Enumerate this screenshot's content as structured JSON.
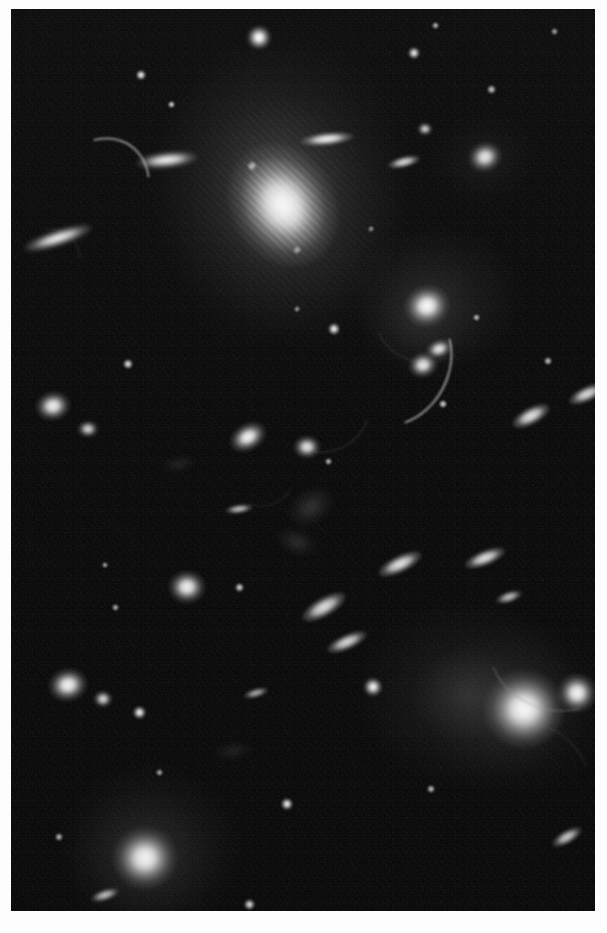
{
  "view": {
    "title": "Galaxy Cluster Deep Field",
    "subject": "galaxy cluster with gravitational lensing arcs",
    "medium": "grayscale astronomical photograph",
    "canvas_width": 607,
    "canvas_height": 933,
    "plate": {
      "left": 11,
      "top": 9,
      "width": 584,
      "height": 902
    },
    "background_color": "#ffffff",
    "sky_color": "#060606",
    "source_color": "#ffffff",
    "caption": ""
  },
  "chart_data": {
    "type": "scatter",
    "xlabel": "",
    "ylabel": "",
    "xlim": [
      0,
      584
    ],
    "ylim": [
      0,
      902
    ],
    "grid": false,
    "legend": "none",
    "annotations": [
      "central cD elliptical galaxy with extended halo",
      "secondary bright elliptical galaxy lower right",
      "multiple gravitationally lensed arcs",
      "numerous cluster member galaxies and foreground stars"
    ],
    "objects": [
      {
        "name": "star-01",
        "kind": "star",
        "x": 248,
        "y": 28,
        "w": 26,
        "h": 25,
        "angle": 0,
        "brightness": 0.98
      },
      {
        "name": "star-02",
        "kind": "star",
        "x": 130,
        "y": 66,
        "w": 12,
        "h": 12,
        "angle": 0,
        "brightness": 0.82
      },
      {
        "name": "star-03",
        "kind": "star",
        "x": 160,
        "y": 95,
        "w": 9,
        "h": 9,
        "angle": 0,
        "brightness": 0.68
      },
      {
        "name": "star-04",
        "kind": "star",
        "x": 403,
        "y": 44,
        "w": 14,
        "h": 14,
        "angle": 0,
        "brightness": 0.8
      },
      {
        "name": "star-05",
        "kind": "star",
        "x": 424,
        "y": 16,
        "w": 9,
        "h": 9,
        "angle": 0,
        "brightness": 0.58
      },
      {
        "name": "star-06",
        "kind": "star",
        "x": 543,
        "y": 22,
        "w": 9,
        "h": 9,
        "angle": 0,
        "brightness": 0.52
      },
      {
        "name": "star-07",
        "kind": "star",
        "x": 480,
        "y": 80,
        "w": 11,
        "h": 11,
        "angle": 0,
        "brightness": 0.66
      },
      {
        "name": "star-08",
        "kind": "star",
        "x": 241,
        "y": 157,
        "w": 12,
        "h": 12,
        "angle": 0,
        "brightness": 0.86
      },
      {
        "name": "star-09",
        "kind": "star",
        "x": 286,
        "y": 241,
        "w": 10,
        "h": 10,
        "angle": 0,
        "brightness": 0.74
      },
      {
        "name": "star-10",
        "kind": "star",
        "x": 323,
        "y": 320,
        "w": 14,
        "h": 14,
        "angle": 0,
        "brightness": 0.84
      },
      {
        "name": "star-11",
        "kind": "star",
        "x": 432,
        "y": 395,
        "w": 10,
        "h": 10,
        "angle": 0,
        "brightness": 0.72
      },
      {
        "name": "star-12",
        "kind": "star",
        "x": 117,
        "y": 355,
        "w": 12,
        "h": 12,
        "angle": 0,
        "brightness": 0.76
      },
      {
        "name": "star-13",
        "kind": "star",
        "x": 465,
        "y": 308,
        "w": 9,
        "h": 9,
        "angle": 0,
        "brightness": 0.6
      },
      {
        "name": "star-14",
        "kind": "star",
        "x": 537,
        "y": 352,
        "w": 10,
        "h": 10,
        "angle": 0,
        "brightness": 0.64
      },
      {
        "name": "star-15",
        "kind": "star",
        "x": 317,
        "y": 452,
        "w": 9,
        "h": 9,
        "angle": 0,
        "brightness": 0.58
      },
      {
        "name": "star-16",
        "kind": "star",
        "x": 228,
        "y": 578,
        "w": 11,
        "h": 11,
        "angle": 0,
        "brightness": 0.7
      },
      {
        "name": "star-17",
        "kind": "star",
        "x": 104,
        "y": 598,
        "w": 9,
        "h": 9,
        "angle": 0,
        "brightness": 0.56
      },
      {
        "name": "star-18",
        "kind": "star",
        "x": 362,
        "y": 678,
        "w": 20,
        "h": 20,
        "angle": 0,
        "brightness": 0.92
      },
      {
        "name": "star-19",
        "kind": "star",
        "x": 276,
        "y": 795,
        "w": 14,
        "h": 14,
        "angle": 0,
        "brightness": 0.82
      },
      {
        "name": "star-20",
        "kind": "star",
        "x": 128,
        "y": 703,
        "w": 15,
        "h": 15,
        "angle": 0,
        "brightness": 0.84
      },
      {
        "name": "star-21",
        "kind": "star",
        "x": 590,
        "y": 668,
        "w": 10,
        "h": 10,
        "angle": 0,
        "brightness": 0.62
      },
      {
        "name": "star-22",
        "kind": "star",
        "x": 420,
        "y": 780,
        "w": 10,
        "h": 10,
        "angle": 0,
        "brightness": 0.62
      },
      {
        "name": "star-23",
        "kind": "star",
        "x": 148,
        "y": 763,
        "w": 9,
        "h": 9,
        "angle": 0,
        "brightness": 0.54
      },
      {
        "name": "star-24",
        "kind": "star",
        "x": 48,
        "y": 828,
        "w": 10,
        "h": 10,
        "angle": 0,
        "brightness": 0.6
      },
      {
        "name": "star-25",
        "kind": "star",
        "x": 238,
        "y": 895,
        "w": 13,
        "h": 13,
        "angle": 0,
        "brightness": 0.74
      },
      {
        "name": "star-26",
        "kind": "star",
        "x": 94,
        "y": 556,
        "w": 8,
        "h": 8,
        "angle": 0,
        "brightness": 0.5
      },
      {
        "name": "star-27",
        "kind": "star",
        "x": 286,
        "y": 300,
        "w": 8,
        "h": 8,
        "angle": 0,
        "brightness": 0.5
      },
      {
        "name": "star-28",
        "kind": "star",
        "x": 360,
        "y": 220,
        "w": 8,
        "h": 8,
        "angle": 0,
        "brightness": 0.48
      },
      {
        "name": "galaxy-cd-central",
        "kind": "ellipse",
        "x": 272,
        "y": 196,
        "w": 104,
        "h": 128,
        "angle": -28,
        "brightness": 1.0
      },
      {
        "name": "galaxy-cd-halo",
        "kind": "halo",
        "x": 272,
        "y": 190,
        "w": 230,
        "h": 290,
        "angle": -25,
        "brightness": 0.42
      },
      {
        "name": "galaxy-bright-br",
        "kind": "ellipse",
        "x": 513,
        "y": 700,
        "w": 80,
        "h": 78,
        "angle": 0,
        "brightness": 1.0
      },
      {
        "name": "galaxy-bright-br-halo",
        "kind": "halo",
        "x": 508,
        "y": 700,
        "w": 190,
        "h": 180,
        "angle": -10,
        "brightness": 0.4
      },
      {
        "name": "galaxy-companion-br",
        "kind": "ellipse",
        "x": 566,
        "y": 684,
        "w": 40,
        "h": 40,
        "angle": 0,
        "brightness": 0.94
      },
      {
        "name": "galaxy-bright-bl",
        "kind": "ellipse",
        "x": 134,
        "y": 849,
        "w": 64,
        "h": 62,
        "angle": 0,
        "brightness": 0.98
      },
      {
        "name": "galaxy-bright-bl-halo",
        "kind": "halo",
        "x": 134,
        "y": 849,
        "w": 150,
        "h": 140,
        "angle": 0,
        "brightness": 0.36
      },
      {
        "name": "galaxy-group-bright",
        "kind": "ellipse",
        "x": 416,
        "y": 297,
        "w": 46,
        "h": 42,
        "angle": -15,
        "brightness": 1.0
      },
      {
        "name": "galaxy-group-halo",
        "kind": "halo",
        "x": 410,
        "y": 310,
        "w": 130,
        "h": 130,
        "angle": 0,
        "brightness": 0.34
      },
      {
        "name": "galaxy-group-b",
        "kind": "ellipse",
        "x": 428,
        "y": 340,
        "w": 28,
        "h": 20,
        "angle": -20,
        "brightness": 0.88
      },
      {
        "name": "galaxy-group-c",
        "kind": "ellipse",
        "x": 412,
        "y": 356,
        "w": 30,
        "h": 26,
        "angle": -15,
        "brightness": 0.9
      },
      {
        "name": "galaxy-upper-right",
        "kind": "ellipse",
        "x": 474,
        "y": 148,
        "w": 34,
        "h": 30,
        "angle": -20,
        "brightness": 0.9
      },
      {
        "name": "galaxy-upper-right-halo",
        "kind": "halo",
        "x": 474,
        "y": 150,
        "w": 110,
        "h": 90,
        "angle": -15,
        "brightness": 0.3
      },
      {
        "name": "galaxy-ne-small",
        "kind": "ellipse",
        "x": 414,
        "y": 120,
        "w": 16,
        "h": 14,
        "angle": 0,
        "brightness": 0.78
      },
      {
        "name": "galaxy-mid-left",
        "kind": "ellipse",
        "x": 42,
        "y": 397,
        "w": 36,
        "h": 30,
        "angle": -10,
        "brightness": 0.92
      },
      {
        "name": "galaxy-mid-left-b",
        "kind": "ellipse",
        "x": 77,
        "y": 420,
        "w": 22,
        "h": 18,
        "angle": 0,
        "brightness": 0.78
      },
      {
        "name": "galaxy-left-low",
        "kind": "ellipse",
        "x": 57,
        "y": 676,
        "w": 40,
        "h": 34,
        "angle": -12,
        "brightness": 0.94
      },
      {
        "name": "galaxy-left-low-b",
        "kind": "ellipse",
        "x": 92,
        "y": 690,
        "w": 20,
        "h": 18,
        "angle": 0,
        "brightness": 0.8
      },
      {
        "name": "galaxy-center-lo",
        "kind": "ellipse",
        "x": 176,
        "y": 578,
        "w": 38,
        "h": 34,
        "angle": 0,
        "brightness": 0.92
      },
      {
        "name": "galaxy-center-top",
        "kind": "ellipse",
        "x": 237,
        "y": 428,
        "w": 40,
        "h": 28,
        "angle": -30,
        "brightness": 0.94
      },
      {
        "name": "galaxy-center-mid",
        "kind": "ellipse",
        "x": 296,
        "y": 438,
        "w": 28,
        "h": 24,
        "angle": 0,
        "brightness": 0.86
      },
      {
        "name": "disk-top-left",
        "kind": "disk",
        "x": 47,
        "y": 229,
        "w": 72,
        "h": 16,
        "angle": -18,
        "brightness": 0.96
      },
      {
        "name": "disk-top-mid",
        "kind": "disk",
        "x": 156,
        "y": 151,
        "w": 62,
        "h": 16,
        "angle": -6,
        "brightness": 0.98
      },
      {
        "name": "disk-top-right",
        "kind": "disk",
        "x": 316,
        "y": 130,
        "w": 54,
        "h": 14,
        "angle": -6,
        "brightness": 0.92
      },
      {
        "name": "disk-up-right-2",
        "kind": "disk",
        "x": 393,
        "y": 153,
        "w": 34,
        "h": 12,
        "angle": -14,
        "brightness": 0.82
      },
      {
        "name": "disk-mid-right",
        "kind": "disk",
        "x": 520,
        "y": 407,
        "w": 42,
        "h": 18,
        "angle": -28,
        "brightness": 0.88
      },
      {
        "name": "disk-right-edge",
        "kind": "disk",
        "x": 576,
        "y": 385,
        "w": 40,
        "h": 16,
        "angle": -25,
        "brightness": 0.84
      },
      {
        "name": "disk-mid-right-lo",
        "kind": "disk",
        "x": 474,
        "y": 549,
        "w": 44,
        "h": 16,
        "angle": -22,
        "brightness": 0.86
      },
      {
        "name": "disk-mid-center",
        "kind": "disk",
        "x": 389,
        "y": 555,
        "w": 48,
        "h": 18,
        "angle": -26,
        "brightness": 0.88
      },
      {
        "name": "disk-center-low",
        "kind": "disk",
        "x": 313,
        "y": 598,
        "w": 50,
        "h": 20,
        "angle": -30,
        "brightness": 0.86
      },
      {
        "name": "disk-low-center",
        "kind": "disk",
        "x": 336,
        "y": 633,
        "w": 44,
        "h": 16,
        "angle": -24,
        "brightness": 0.82
      },
      {
        "name": "disk-low-right",
        "kind": "disk",
        "x": 498,
        "y": 588,
        "w": 28,
        "h": 12,
        "angle": -18,
        "brightness": 0.7
      },
      {
        "name": "disk-left-small",
        "kind": "disk",
        "x": 228,
        "y": 500,
        "w": 28,
        "h": 10,
        "angle": -8,
        "brightness": 0.7
      },
      {
        "name": "disk-bottom-right",
        "kind": "disk",
        "x": 556,
        "y": 828,
        "w": 34,
        "h": 14,
        "angle": -30,
        "brightness": 0.76
      },
      {
        "name": "disk-bottom-left",
        "kind": "disk",
        "x": 94,
        "y": 886,
        "w": 30,
        "h": 12,
        "angle": -18,
        "brightness": 0.7
      },
      {
        "name": "disk-mid-low-2",
        "kind": "disk",
        "x": 245,
        "y": 684,
        "w": 26,
        "h": 10,
        "angle": -16,
        "brightness": 0.62
      },
      {
        "name": "arc-upper-left",
        "kind": "arc",
        "x": 83,
        "y": 185,
        "w": 96,
        "h": 120,
        "angle": 34,
        "thickness": 2.4,
        "brightness": 0.82
      },
      {
        "name": "arc-center-right",
        "kind": "arc",
        "x": 381,
        "y": 352,
        "w": 128,
        "h": 108,
        "angle": 118,
        "thickness": 2.2,
        "brightness": 0.86
      },
      {
        "name": "arc-lens-ring",
        "kind": "arc",
        "x": 414,
        "y": 300,
        "w": 104,
        "h": 104,
        "angle": 200,
        "thickness": 1.8,
        "brightness": 0.55
      },
      {
        "name": "arc-lower-left",
        "kind": "arc",
        "x": 316,
        "y": 405,
        "w": 84,
        "h": 70,
        "angle": 150,
        "thickness": 1.8,
        "brightness": 0.58
      },
      {
        "name": "arc-far-left",
        "kind": "arc",
        "x": 30,
        "y": 258,
        "w": 66,
        "h": 84,
        "angle": 40,
        "thickness": 1.6,
        "brightness": 0.46
      },
      {
        "name": "arc-bottom-right",
        "kind": "arc",
        "x": 540,
        "y": 642,
        "w": 130,
        "h": 110,
        "angle": 205,
        "thickness": 2.0,
        "brightness": 0.6
      },
      {
        "name": "arc-bottom-right-2",
        "kind": "arc",
        "x": 520,
        "y": 760,
        "w": 120,
        "h": 90,
        "angle": 30,
        "thickness": 1.6,
        "brightness": 0.42
      },
      {
        "name": "arc-mid-center",
        "kind": "arc",
        "x": 252,
        "y": 470,
        "w": 60,
        "h": 50,
        "angle": 160,
        "thickness": 1.4,
        "brightness": 0.4
      },
      {
        "name": "wisp-center",
        "kind": "wisp",
        "x": 300,
        "y": 498,
        "w": 48,
        "h": 34,
        "angle": -35,
        "brightness": 0.52
      },
      {
        "name": "wisp-center-2",
        "kind": "wisp",
        "x": 286,
        "y": 533,
        "w": 40,
        "h": 26,
        "angle": 20,
        "brightness": 0.44
      },
      {
        "name": "wisp-left",
        "kind": "wisp",
        "x": 168,
        "y": 455,
        "w": 34,
        "h": 16,
        "angle": -10,
        "brightness": 0.34
      },
      {
        "name": "wisp-lower",
        "kind": "wisp",
        "x": 222,
        "y": 742,
        "w": 40,
        "h": 18,
        "angle": -12,
        "brightness": 0.3
      }
    ]
  }
}
